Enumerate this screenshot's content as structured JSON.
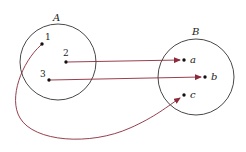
{
  "diagram": {
    "type": "function mapping",
    "colors": {
      "arrow": "#8b2a3a",
      "circle": "#333333",
      "dot": "#111111"
    },
    "set_A": {
      "label": "A",
      "elements": [
        {
          "label": "1"
        },
        {
          "label": "2"
        },
        {
          "label": "3"
        }
      ]
    },
    "set_B": {
      "label": "B",
      "elements": [
        {
          "label": "a"
        },
        {
          "label": "b"
        },
        {
          "label": "c"
        }
      ]
    },
    "mappings": [
      {
        "from": "1",
        "to": "c"
      },
      {
        "from": "2",
        "to": "a"
      },
      {
        "from": "3",
        "to": "b"
      }
    ]
  }
}
